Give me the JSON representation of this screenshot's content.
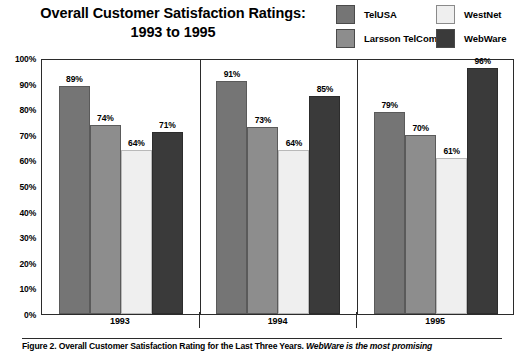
{
  "title": {
    "line1": "Overall Customer Satisfaction Ratings:",
    "line2": "1993 to 1995"
  },
  "legend": {
    "items": [
      {
        "label": "TelUSA",
        "color": "#757575"
      },
      {
        "label": "WestNet",
        "color": "#efefef"
      },
      {
        "label": "Larsson TelCom",
        "color": "#8d8d8d"
      },
      {
        "label": "WebWare",
        "color": "#3a3a3a"
      }
    ]
  },
  "caption": {
    "figure_label": "Figure 2. Overall Customer Satisfaction Rating for the Last Three Years.",
    "note": "WebWare is the most promising"
  },
  "chart_data": {
    "type": "bar",
    "title": "Overall Customer Satisfaction Ratings: 1993 to 1995",
    "xlabel": "",
    "ylabel": "",
    "categories": [
      "1993",
      "1994",
      "1995"
    ],
    "ylim": [
      0,
      100
    ],
    "yticks": [
      "0%",
      "10%",
      "20%",
      "30%",
      "40%",
      "50%",
      "60%",
      "70%",
      "80%",
      "90%",
      "100%"
    ],
    "ytick_values": [
      0,
      10,
      20,
      30,
      40,
      50,
      60,
      70,
      80,
      90,
      100
    ],
    "grid": false,
    "legend_position": "top-right",
    "value_suffix": "%",
    "series": [
      {
        "name": "TelUSA",
        "color": "#757575",
        "values": [
          89,
          91,
          79
        ],
        "labels": [
          "89%",
          "91%",
          "79%"
        ]
      },
      {
        "name": "Larsson TelCom",
        "color": "#8d8d8d",
        "values": [
          74,
          73,
          70
        ],
        "labels": [
          "74%",
          "73%",
          "70%"
        ]
      },
      {
        "name": "WestNet",
        "color": "#efefef",
        "values": [
          64,
          64,
          61
        ],
        "labels": [
          "64%",
          "64%",
          "61%"
        ]
      },
      {
        "name": "WebWare",
        "color": "#3a3a3a",
        "values": [
          71,
          85,
          96
        ],
        "labels": [
          "71%",
          "85%",
          "96%"
        ]
      }
    ]
  }
}
